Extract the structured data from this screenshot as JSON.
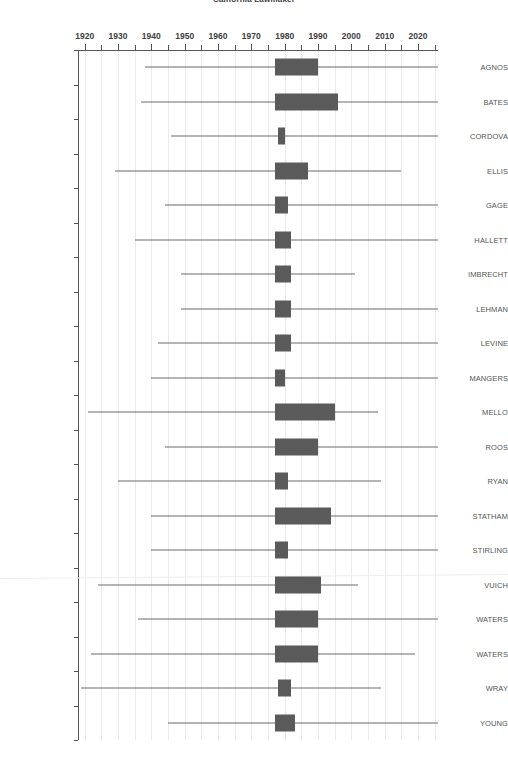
{
  "chart_data": {
    "type": "box",
    "title": "California Lawmaker",
    "xlabel": "",
    "ylabel": "",
    "xlim": [
      1918,
      2026
    ],
    "grid": true,
    "legend": null,
    "x_ticks_major": [
      1920,
      1930,
      1940,
      1950,
      1960,
      1970,
      1980,
      1990,
      2000,
      2010,
      2020
    ],
    "x_ticks_minor": [
      1925,
      1935,
      1945,
      1955,
      1965,
      1975,
      1985,
      1995,
      2005,
      2015,
      2025
    ],
    "box_color": "#5a5a5a",
    "whisker_color": "#6b6b6b",
    "grid_color": "#e9e9ee",
    "categories": [
      "AGNOS",
      "BATES",
      "CORDOVA",
      "ELLIS",
      "GAGE",
      "HALLETT",
      "IMBRECHT",
      "LEHMAN",
      "LEVINE",
      "MANGERS",
      "MELLO",
      "ROOS",
      "RYAN",
      "STATHAM",
      "STIRLING",
      "VUICH",
      "WATERS",
      "WATERS",
      "WRAY",
      "YOUNG"
    ],
    "boxes": [
      {
        "label": "AGNOS",
        "whisker_low": 1938,
        "q1": 1977,
        "q3": 1990,
        "whisker_high": 2026
      },
      {
        "label": "BATES",
        "whisker_low": 1937,
        "q1": 1977,
        "q3": 1996,
        "whisker_high": 2026
      },
      {
        "label": "CORDOVA",
        "whisker_low": 1946,
        "q1": 1978,
        "q3": 1980,
        "whisker_high": 2026
      },
      {
        "label": "ELLIS",
        "whisker_low": 1929,
        "q1": 1977,
        "q3": 1987,
        "whisker_high": 2015
      },
      {
        "label": "GAGE",
        "whisker_low": 1944,
        "q1": 1977,
        "q3": 1981,
        "whisker_high": 2026
      },
      {
        "label": "HALLETT",
        "whisker_low": 1935,
        "q1": 1977,
        "q3": 1982,
        "whisker_high": 2026
      },
      {
        "label": "IMBRECHT",
        "whisker_low": 1949,
        "q1": 1977,
        "q3": 1982,
        "whisker_high": 2001
      },
      {
        "label": "LEHMAN",
        "whisker_low": 1949,
        "q1": 1977,
        "q3": 1982,
        "whisker_high": 2026
      },
      {
        "label": "LEVINE",
        "whisker_low": 1942,
        "q1": 1977,
        "q3": 1982,
        "whisker_high": 2026
      },
      {
        "label": "MANGERS",
        "whisker_low": 1940,
        "q1": 1977,
        "q3": 1980,
        "whisker_high": 2026
      },
      {
        "label": "MELLO",
        "whisker_low": 1921,
        "q1": 1977,
        "q3": 1995,
        "whisker_high": 2008
      },
      {
        "label": "ROOS",
        "whisker_low": 1944,
        "q1": 1977,
        "q3": 1990,
        "whisker_high": 2026
      },
      {
        "label": "RYAN",
        "whisker_low": 1930,
        "q1": 1977,
        "q3": 1981,
        "whisker_high": 2009
      },
      {
        "label": "STATHAM",
        "whisker_low": 1940,
        "q1": 1977,
        "q3": 1994,
        "whisker_high": 2026
      },
      {
        "label": "STIRLING",
        "whisker_low": 1940,
        "q1": 1977,
        "q3": 1981,
        "whisker_high": 2026
      },
      {
        "label": "VUICH",
        "whisker_low": 1924,
        "q1": 1977,
        "q3": 1991,
        "whisker_high": 2002
      },
      {
        "label": "WATERS",
        "whisker_low": 1936,
        "q1": 1977,
        "q3": 1990,
        "whisker_high": 2026
      },
      {
        "label": "WATERS",
        "whisker_low": 1922,
        "q1": 1977,
        "q3": 1990,
        "whisker_high": 2019
      },
      {
        "label": "WRAY",
        "whisker_low": 1919,
        "q1": 1978,
        "q3": 1982,
        "whisker_high": 2009
      },
      {
        "label": "YOUNG",
        "whisker_low": 1945,
        "q1": 1977,
        "q3": 1983,
        "whisker_high": 2026
      }
    ]
  }
}
